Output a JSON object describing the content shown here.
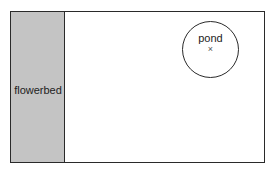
{
  "diagram": {
    "type": "garden-plan",
    "regions": [
      {
        "name": "flowerbed",
        "label": "flowerbed",
        "fill": "#c4c4c4"
      },
      {
        "name": "pond",
        "label": "pond",
        "shape": "circle",
        "center_marker": "×"
      }
    ],
    "colors": {
      "outline": "#2a2a2a",
      "flowerbed_fill": "#c4c4c4",
      "background": "#ffffff"
    }
  }
}
